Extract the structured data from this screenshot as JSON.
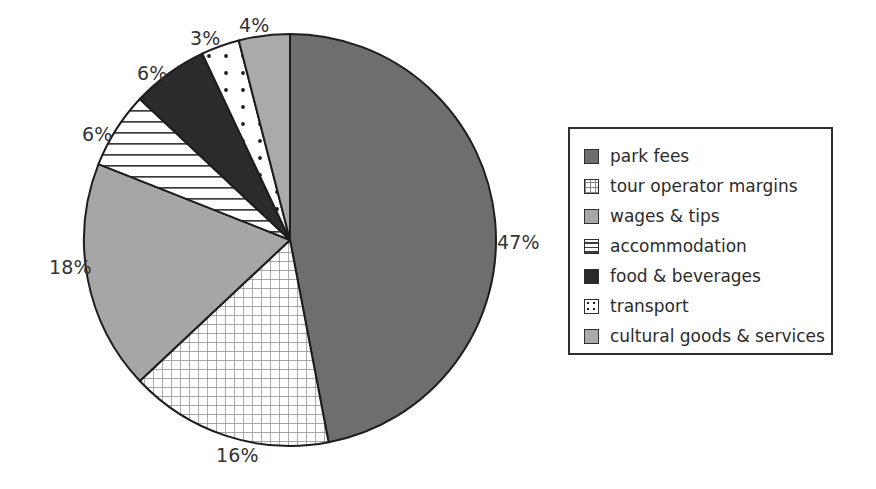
{
  "chart_data": {
    "type": "pie",
    "title": "",
    "labels": [
      "park fees",
      "tour operator margins",
      "wages & tips",
      "accommodation",
      "food & beverages",
      "transport",
      "cultural goods & services"
    ],
    "values": [
      47,
      16,
      18,
      6,
      6,
      3,
      4
    ],
    "value_labels": [
      "47%",
      "16%",
      "18%",
      "6%",
      "6%",
      "3%",
      "4%"
    ],
    "unit": "%",
    "start_angle_deg": 0,
    "direction": "clockwise",
    "legend_position": "right",
    "grid": false,
    "slice_styles": [
      {
        "name": "park fees",
        "fill": "#6e6e6e",
        "pattern": "solid",
        "stroke": "#1d1d1d"
      },
      {
        "name": "tour operator margins",
        "fill": "#ffffff",
        "pattern": "grid",
        "pattern_color": "#8a8a8a",
        "stroke": "#1d1d1d"
      },
      {
        "name": "wages & tips",
        "fill": "#a6a6a6",
        "pattern": "solid",
        "stroke": "#1d1d1d"
      },
      {
        "name": "accommodation",
        "fill": "#ffffff",
        "pattern": "horizontal-lines",
        "pattern_color": "#3b3b3b",
        "stroke": "#1d1d1d"
      },
      {
        "name": "food & beverages",
        "fill": "#2b2b2b",
        "pattern": "solid",
        "stroke": "#1d1d1d"
      },
      {
        "name": "transport",
        "fill": "#ffffff",
        "pattern": "dots",
        "pattern_color": "#1d1d1d",
        "stroke": "#1d1d1d"
      },
      {
        "name": "cultural goods & services",
        "fill": "#aaaaaa",
        "pattern": "solid",
        "stroke": "#1d1d1d"
      }
    ],
    "label_positions": [
      {
        "text": "47%",
        "x": 497,
        "y": 231
      },
      {
        "text": "16%",
        "x": 216,
        "y": 444
      },
      {
        "text": "18%",
        "x": 49,
        "y": 256
      },
      {
        "text": "6%",
        "x": 82,
        "y": 123
      },
      {
        "text": "6%",
        "x": 137,
        "y": 62
      },
      {
        "text": "3%",
        "x": 190,
        "y": 27
      },
      {
        "text": "4%",
        "x": 239,
        "y": 14
      }
    ],
    "geometry": {
      "cx": 290,
      "cy": 240,
      "r": 206
    }
  },
  "legend": {
    "items": [
      {
        "label": "park fees",
        "swatch": "swatch-solid-dark-gray"
      },
      {
        "label": "tour operator margins",
        "swatch": "swatch-grid-hatch"
      },
      {
        "label": "wages & tips",
        "swatch": "swatch-solid-light-gray"
      },
      {
        "label": "accommodation",
        "swatch": "swatch-horizontal-lines"
      },
      {
        "label": "food & beverages",
        "swatch": "swatch-solid-black"
      },
      {
        "label": "transport",
        "swatch": "swatch-dotted"
      },
      {
        "label": "cultural goods & services",
        "swatch": "swatch-solid-mid-gray"
      }
    ]
  },
  "colors": {
    "park_fees": "#6e6e6e",
    "wages_tips": "#a6a6a6",
    "food_beverages": "#2b2b2b",
    "cultural_goods": "#aaaaaa",
    "outline": "#1d1d1d",
    "background": "#ffffff"
  }
}
